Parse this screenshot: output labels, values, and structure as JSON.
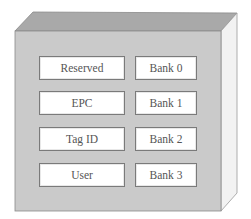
{
  "diagram": {
    "title": "",
    "container": "memory-block-cube",
    "rows": [
      {
        "field": "Reserved",
        "bank": "Bank 0"
      },
      {
        "field": "EPC",
        "bank": "Bank 1"
      },
      {
        "field": "Tag ID",
        "bank": "Bank 2"
      },
      {
        "field": "User",
        "bank": "Bank 3"
      }
    ],
    "colors": {
      "front_face": "#c9c9c9",
      "top_face": "#a8a8a8",
      "side_face": "#f0f0f0",
      "box_fill": "#ffffff",
      "box_border": "#7a7a7a",
      "text": "#555555"
    }
  }
}
